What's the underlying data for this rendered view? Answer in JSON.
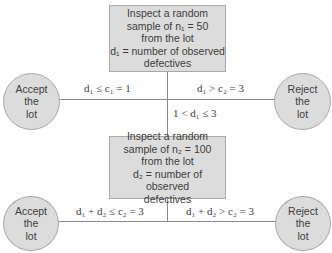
{
  "diagram": {
    "type": "double-sampling-plan-flowchart",
    "first_sample_box": {
      "lines": [
        "Inspect a random",
        "sample of n₁ = 50",
        "from the lot",
        "d₁ = number of observed",
        "defectives"
      ]
    },
    "second_sample_box": {
      "lines": [
        "Inspect a random",
        "sample of n₂ = 100",
        "from the lot",
        "d₂ = number of observed",
        "defectives"
      ]
    },
    "accept_1": {
      "lines": [
        "Accept",
        "the",
        "lot"
      ]
    },
    "reject_1": {
      "lines": [
        "Reject",
        "the",
        "lot"
      ]
    },
    "accept_2": {
      "lines": [
        "Accept",
        "the",
        "lot"
      ]
    },
    "reject_2": {
      "lines": [
        "Reject",
        "the",
        "lot"
      ]
    },
    "edges": {
      "accept_1": "d₁ ≤ c₁ = 1",
      "reject_1": "d₁ > c₂ = 3",
      "continue": "1 < d₁ ≤ 3",
      "accept_2": "d₁ + d₂ ≤ c₂ = 3",
      "reject_2": "d₁ + d₂ > c₂ = 3"
    },
    "colors": {
      "fill": "#dcdcdc",
      "border": "#a9a9a9",
      "line": "#8a8a8a",
      "text": "#3c3c3c"
    }
  }
}
